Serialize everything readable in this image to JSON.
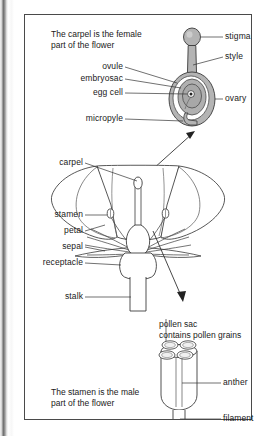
{
  "figure": {
    "title_top": "The carpel is the female\npart of the flower",
    "title_top_line1": "The carpel is the female",
    "title_top_line2": "part of the flower",
    "title_bottom_line1": "The stamen is the male",
    "title_bottom_line2": "part of the flower",
    "border_color": "#4a4a4a",
    "background_color": "#ffffff",
    "ink_color": "#1a1a1a",
    "fill_grey": "#b8b8b8"
  },
  "carpel_diagram": {
    "name": "carpel-diagram",
    "labels_right": [
      {
        "key": "stigma",
        "text": "stigma"
      },
      {
        "key": "style",
        "text": "style"
      },
      {
        "key": "ovary",
        "text": "ovary"
      }
    ],
    "labels_left": [
      {
        "key": "ovule",
        "text": "ovule"
      },
      {
        "key": "embryosac",
        "text": "embryosac"
      },
      {
        "key": "egg_cell",
        "text": "egg cell"
      },
      {
        "key": "micropyle",
        "text": "micropyle"
      }
    ]
  },
  "flower_diagram": {
    "name": "flower-diagram",
    "labels_left": [
      {
        "key": "carpel",
        "text": "carpel"
      },
      {
        "key": "stamen",
        "text": "stamen"
      },
      {
        "key": "petal",
        "text": "petal"
      },
      {
        "key": "sepal",
        "text": "sepal"
      },
      {
        "key": "receptacle",
        "text": "receptacle"
      },
      {
        "key": "stalk",
        "text": "stalk"
      }
    ]
  },
  "stamen_diagram": {
    "name": "stamen-diagram",
    "pollen_sac_line1": "pollen sac",
    "pollen_sac_line2": "contains pollen grains",
    "labels_right": [
      {
        "key": "anther",
        "text": "anther"
      },
      {
        "key": "filament",
        "text": "filament"
      }
    ]
  }
}
